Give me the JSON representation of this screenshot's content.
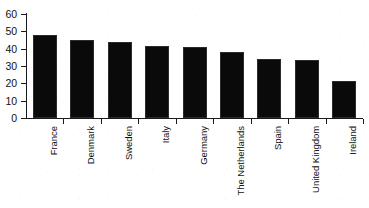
{
  "chart_data": {
    "type": "bar",
    "title": "",
    "subtitle": "",
    "xlabel": "",
    "ylabel": "",
    "categories": [
      "France",
      "Denmark",
      "Sweden",
      "Italy",
      "Germany",
      "The Netherlands",
      "Spain",
      "United Kingdom",
      "Ireland"
    ],
    "values": [
      48,
      45,
      44,
      41.5,
      41,
      38,
      34,
      33.5,
      21.5
    ],
    "ylim": [
      0,
      60
    ],
    "ytick_labels": [
      "60",
      "50",
      "40",
      "30",
      "20",
      "10",
      "0"
    ],
    "ytick_values": [
      60,
      50,
      40,
      30,
      20,
      10,
      0
    ],
    "ytick_step": 10,
    "grid": false,
    "legend": null,
    "legend_position": "none",
    "bar_color": "#0a0a0a",
    "bar_edge_color": "#2b2b2b",
    "axis_color": "#1a1a1a",
    "background_color": "#ffffff",
    "xtick_label_rotation": -90,
    "annotations": []
  }
}
